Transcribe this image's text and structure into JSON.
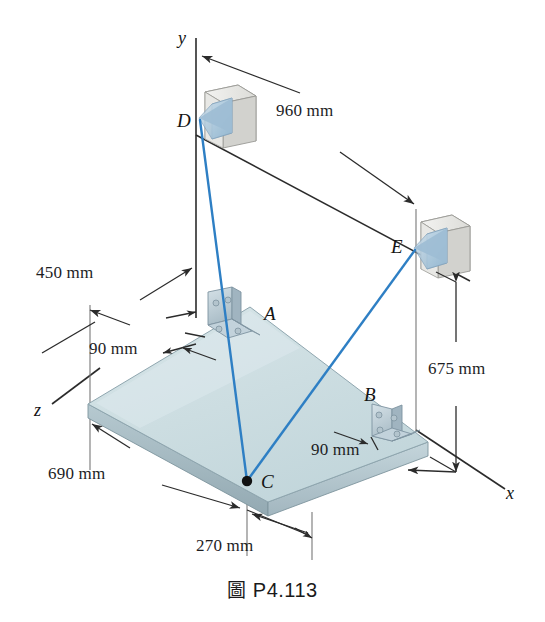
{
  "figure": {
    "caption_prefix": "圖",
    "caption_id": "P4.113"
  },
  "axes": {
    "y_label": "y",
    "x_label": "x",
    "z_label": "z"
  },
  "points": [
    {
      "id": "A",
      "label": "A",
      "kind": "bracket-on-plate"
    },
    {
      "id": "B",
      "label": "B",
      "kind": "bracket-on-plate"
    },
    {
      "id": "C",
      "label": "C",
      "kind": "cable-junction-point"
    },
    {
      "id": "D",
      "label": "D",
      "kind": "wall-anchor"
    },
    {
      "id": "E",
      "label": "E",
      "kind": "wall-anchor"
    }
  ],
  "dimensions": [
    {
      "id": "d-960",
      "value": "960 mm",
      "from": "y-axis",
      "to": "E-wall"
    },
    {
      "id": "d-450",
      "value": "450 mm",
      "from": "z-plate-edge",
      "to": "y-axis"
    },
    {
      "id": "d-675",
      "value": "675 mm",
      "from": "E-level",
      "to": "plate-level"
    },
    {
      "id": "d-690",
      "value": "690 mm",
      "from": "plate-left-edge",
      "to": "C"
    },
    {
      "id": "d-270",
      "value": "270 mm",
      "from": "C",
      "to": "plate-front-corner"
    },
    {
      "id": "d-90-a",
      "value": "90 mm",
      "from": "plate-edge",
      "to": "bracket-A"
    },
    {
      "id": "d-90-b",
      "value": "90 mm",
      "from": "plate-edge",
      "to": "bracket-B"
    }
  ],
  "cables": [
    {
      "id": "cable-DC",
      "from": "D",
      "to": "C"
    },
    {
      "id": "cable-EC",
      "from": "E",
      "to": "C"
    }
  ],
  "colors": {
    "cable": "#2E7FC4",
    "plate_top": "#cfdfe2",
    "plate_edge": "#9fb3bb",
    "bracket": "#b9c9d2",
    "wall_block": "#d8d8d4",
    "line": "#2b2b2b"
  }
}
